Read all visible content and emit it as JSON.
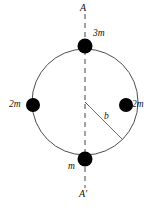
{
  "figure": {
    "title": "",
    "background_color": "#ffffff",
    "stroke_color": "#333333",
    "mass_fill_color": "#000000",
    "axis": {
      "top_label": "A",
      "bottom_label": "A′",
      "style": "dashed",
      "orientation": "vertical"
    },
    "ring": {
      "center_x": 85,
      "center_y": 102,
      "radius": 53,
      "shape": "circle"
    },
    "radius_annotation": {
      "label": "b",
      "from": "center",
      "to": "ring-edge",
      "angle_degrees": 315
    },
    "masses": [
      {
        "id": "top",
        "label": "3m",
        "position": "top",
        "cx": 85,
        "cy": 46,
        "r": 7.5
      },
      {
        "id": "left",
        "label": "2m",
        "position": "left",
        "cx": 33,
        "cy": 105,
        "r": 7.0
      },
      {
        "id": "right",
        "label": "2m",
        "position": "right",
        "cx": 126,
        "cy": 105,
        "r": 7.0
      },
      {
        "id": "bottom",
        "label": "m",
        "position": "bottom",
        "cx": 85,
        "cy": 159,
        "r": 7.5
      }
    ]
  }
}
